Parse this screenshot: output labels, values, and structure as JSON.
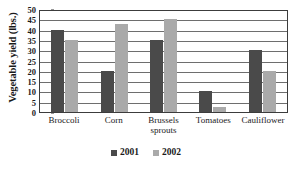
{
  "chart_data": {
    "type": "bar",
    "title": "",
    "xlabel": "",
    "ylabel": "Vegetable yield (lbs.)",
    "ylim": [
      0,
      50
    ],
    "ytick_step": 5,
    "yticks": [
      50,
      45,
      40,
      35,
      30,
      25,
      20,
      15,
      10,
      5,
      0
    ],
    "grid": true,
    "grid_axis": "y",
    "legend_position": "bottom-center",
    "categories": [
      "Broccoli",
      "Corn",
      "Brussels sprouts",
      "Tomatoes",
      "Cauliflower"
    ],
    "category_lines": [
      [
        "Broccoli"
      ],
      [
        "Corn"
      ],
      [
        "Brussels",
        "sprouts"
      ],
      [
        "Tomatoes"
      ],
      [
        "Cauliflower"
      ]
    ],
    "series": [
      {
        "name": "2001",
        "color": "#4a4a4a",
        "values": [
          40,
          20,
          35,
          10,
          30
        ]
      },
      {
        "name": "2002",
        "color": "#aaaaaa",
        "values": [
          35,
          42.5,
          45,
          2.5,
          20
        ]
      }
    ]
  },
  "legend": {
    "items": [
      {
        "label": "2001",
        "color": "#4a4a4a"
      },
      {
        "label": "2002",
        "color": "#aaaaaa"
      }
    ]
  },
  "colors": {
    "series_2001": "#4a4a4a",
    "series_2002": "#aaaaaa",
    "gridline": "#6e6e6e",
    "frame": "#3c3c3c",
    "text": "#1a1a1a",
    "background": "#ffffff"
  }
}
